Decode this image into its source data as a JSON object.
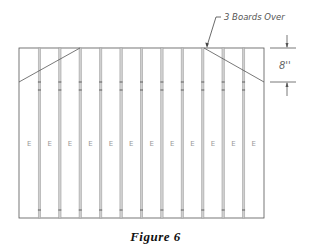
{
  "figure": {
    "caption": "Figure 6",
    "callout_label": "3 Boards Over",
    "dimension_label": "8''",
    "board_count": 12,
    "board_label": "E",
    "boards": [
      {
        "index": 1,
        "label": "E"
      },
      {
        "index": 2,
        "label": "E"
      },
      {
        "index": 3,
        "label": "E"
      },
      {
        "index": 4,
        "label": "E"
      },
      {
        "index": 5,
        "label": "E"
      },
      {
        "index": 6,
        "label": "E"
      },
      {
        "index": 7,
        "label": "E"
      },
      {
        "index": 8,
        "label": "E"
      },
      {
        "index": 9,
        "label": "E"
      },
      {
        "index": 10,
        "label": "E"
      },
      {
        "index": 11,
        "label": "E"
      },
      {
        "index": 12,
        "label": "E"
      }
    ],
    "colors": {
      "line": "#555555",
      "seam": "#9a9a9a",
      "background": "#ffffff",
      "caption": "#111111"
    }
  }
}
